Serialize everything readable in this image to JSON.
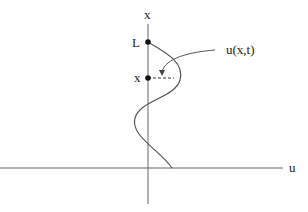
{
  "diagram": {
    "axis_labels": {
      "vertical": "x",
      "horizontal": "u"
    },
    "point_labels": {
      "top": "L",
      "mid": "x"
    },
    "curve_label": "u(x,t)",
    "colors": {
      "line": "#555555",
      "dot": "#111111",
      "text": "#222222"
    }
  }
}
